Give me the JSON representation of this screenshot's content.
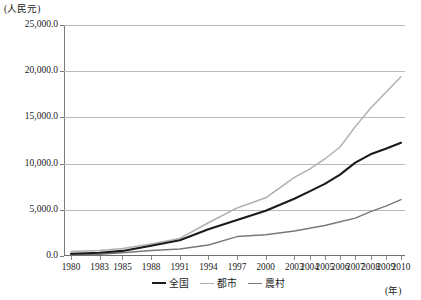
{
  "axes": {
    "y_unit_label": "(人民元)",
    "x_unit_label": "(年)",
    "y_ticks": [
      "25,000.0",
      "20,000.0",
      "15,000.0",
      "10,000.0",
      "5,000.0",
      "0.0"
    ],
    "x_ticks": [
      "1980",
      "1983",
      "1985",
      "1988",
      "1991",
      "1994",
      "1997",
      "2000",
      "2003",
      "2004",
      "2005",
      "2006",
      "2007",
      "2008",
      "2009",
      "2010"
    ]
  },
  "legend": {
    "items": [
      {
        "label": "全国",
        "color": "#1b1b1b"
      },
      {
        "label": "都市",
        "color": "#b0b0b0"
      },
      {
        "label": "農村",
        "color": "#797979"
      }
    ]
  },
  "chart_data": {
    "type": "line",
    "title": "",
    "subtitle": "",
    "xlabel": "(年)",
    "ylabel": "(人民元)",
    "x": [
      1980,
      1983,
      1985,
      1988,
      1991,
      1994,
      1997,
      2000,
      2003,
      2004,
      2005,
      2006,
      2007,
      2008,
      2009,
      2010
    ],
    "xlim": [
      1980,
      2010
    ],
    "ylim": [
      0,
      25000
    ],
    "ytick_step": 5000,
    "grid": "horizontal",
    "legend_position": "bottom-center",
    "series": [
      {
        "name": "全国",
        "color": "#1b1b1b",
        "values": [
          250,
          350,
          550,
          1100,
          1700,
          2900,
          3900,
          4900,
          6200,
          7000,
          7800,
          8800,
          10100,
          11000,
          11600,
          12250
        ]
      },
      {
        "name": "都市",
        "color": "#b0b0b0",
        "values": [
          500,
          600,
          800,
          1300,
          1900,
          3600,
          5200,
          6300,
          8500,
          9400,
          10500,
          11800,
          14000,
          16000,
          17700,
          19400
        ]
      },
      {
        "name": "農村",
        "color": "#797979",
        "values": [
          150,
          200,
          350,
          600,
          750,
          1200,
          2100,
          2300,
          2700,
          3000,
          3300,
          3700,
          4100,
          4800,
          5400,
          6100
        ]
      }
    ]
  }
}
